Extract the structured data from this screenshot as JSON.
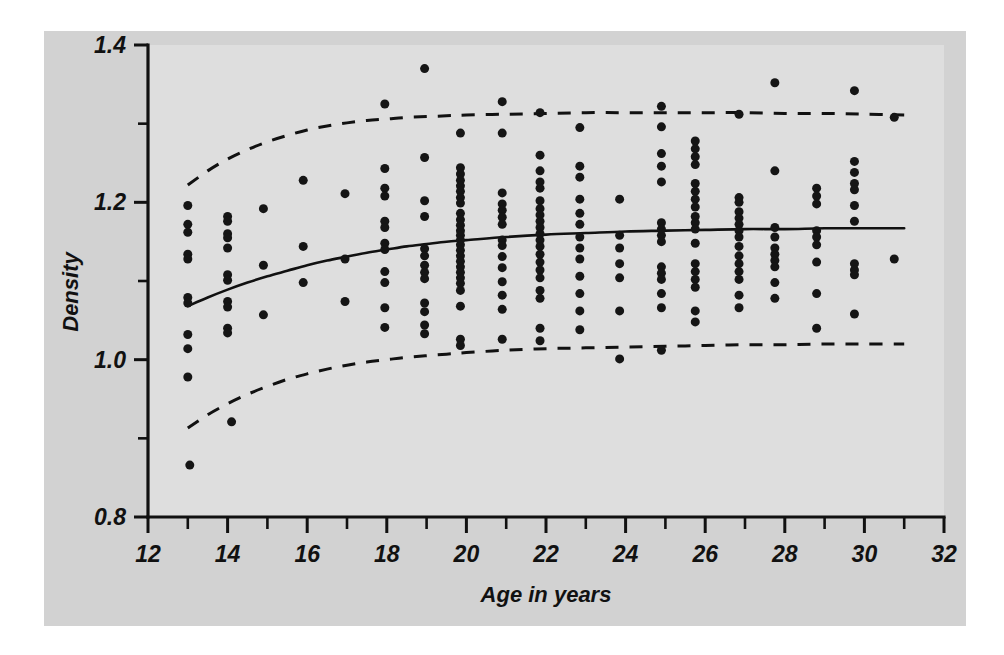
{
  "figure": {
    "background_color": "#d2d2d2",
    "plot_background_color": "#dedede",
    "outer_color": "#ffffff",
    "ink_color": "#111111"
  },
  "axes": {
    "y_title": "Density",
    "x_title": "Age in years",
    "y_major_labels": [
      "1.4",
      "1.2",
      "1.0",
      "0.8"
    ],
    "x_major_labels": [
      "12",
      "14",
      "16",
      "18",
      "20",
      "22",
      "24",
      "26",
      "28",
      "30",
      "32"
    ]
  },
  "chart_data": {
    "type": "scatter",
    "title": "",
    "subtitle": "",
    "xlabel": "Age in years",
    "ylabel": "Density",
    "xlim": [
      12,
      32
    ],
    "ylim": [
      0.8,
      1.4
    ],
    "x_major_ticks": [
      12,
      14,
      16,
      18,
      20,
      22,
      24,
      26,
      28,
      30,
      32
    ],
    "x_minor_ticks": [
      13,
      15,
      17,
      19,
      21,
      23,
      25,
      27,
      29,
      31
    ],
    "y_major_ticks": [
      0.8,
      1.0,
      1.2,
      1.4
    ],
    "y_minor_ticks": [
      0.9,
      1.1,
      1.3
    ],
    "grid": false,
    "legend": null,
    "marker": {
      "shape": "circle",
      "color": "#151515",
      "size_px": 9
    },
    "points": [
      [
        13.0,
        1.196
      ],
      [
        13.0,
        1.172
      ],
      [
        13.0,
        1.162
      ],
      [
        13.0,
        1.134
      ],
      [
        13.0,
        1.128
      ],
      [
        13.0,
        1.079
      ],
      [
        13.0,
        1.072
      ],
      [
        13.0,
        1.032
      ],
      [
        13.0,
        1.014
      ],
      [
        13.0,
        0.978
      ],
      [
        13.05,
        0.866
      ],
      [
        14.0,
        1.182
      ],
      [
        14.0,
        1.176
      ],
      [
        14.0,
        1.16
      ],
      [
        14.0,
        1.155
      ],
      [
        14.0,
        1.142
      ],
      [
        14.0,
        1.108
      ],
      [
        14.0,
        1.101
      ],
      [
        14.0,
        1.074
      ],
      [
        14.0,
        1.067
      ],
      [
        14.0,
        1.04
      ],
      [
        14.0,
        1.034
      ],
      [
        14.1,
        0.921
      ],
      [
        14.9,
        1.192
      ],
      [
        14.9,
        1.12
      ],
      [
        14.9,
        1.057
      ],
      [
        15.9,
        1.228
      ],
      [
        15.9,
        1.144
      ],
      [
        15.9,
        1.098
      ],
      [
        16.95,
        1.211
      ],
      [
        16.95,
        1.128
      ],
      [
        16.95,
        1.074
      ],
      [
        17.95,
        1.325
      ],
      [
        17.95,
        1.243
      ],
      [
        17.95,
        1.218
      ],
      [
        17.95,
        1.208
      ],
      [
        17.95,
        1.176
      ],
      [
        17.95,
        1.168
      ],
      [
        17.95,
        1.148
      ],
      [
        17.95,
        1.14
      ],
      [
        17.95,
        1.112
      ],
      [
        17.95,
        1.098
      ],
      [
        17.95,
        1.066
      ],
      [
        17.95,
        1.041
      ],
      [
        18.95,
        1.37
      ],
      [
        18.95,
        1.257
      ],
      [
        18.95,
        1.202
      ],
      [
        18.95,
        1.182
      ],
      [
        18.95,
        1.141
      ],
      [
        18.95,
        1.132
      ],
      [
        18.95,
        1.12
      ],
      [
        18.95,
        1.111
      ],
      [
        18.95,
        1.103
      ],
      [
        18.95,
        1.072
      ],
      [
        18.95,
        1.061
      ],
      [
        18.95,
        1.044
      ],
      [
        18.95,
        1.033
      ],
      [
        19.85,
        1.288
      ],
      [
        19.85,
        1.244
      ],
      [
        19.85,
        1.236
      ],
      [
        19.85,
        1.228
      ],
      [
        19.85,
        1.221
      ],
      [
        19.85,
        1.214
      ],
      [
        19.85,
        1.206
      ],
      [
        19.85,
        1.199
      ],
      [
        19.85,
        1.186
      ],
      [
        19.85,
        1.178
      ],
      [
        19.85,
        1.171
      ],
      [
        19.85,
        1.164
      ],
      [
        19.85,
        1.158
      ],
      [
        19.85,
        1.152
      ],
      [
        19.85,
        1.146
      ],
      [
        19.85,
        1.139
      ],
      [
        19.85,
        1.132
      ],
      [
        19.85,
        1.125
      ],
      [
        19.85,
        1.118
      ],
      [
        19.85,
        1.111
      ],
      [
        19.85,
        1.104
      ],
      [
        19.85,
        1.097
      ],
      [
        19.85,
        1.088
      ],
      [
        19.85,
        1.068
      ],
      [
        19.85,
        1.026
      ],
      [
        19.85,
        1.018
      ],
      [
        20.9,
        1.328
      ],
      [
        20.9,
        1.288
      ],
      [
        20.9,
        1.212
      ],
      [
        20.9,
        1.198
      ],
      [
        20.9,
        1.19
      ],
      [
        20.9,
        1.181
      ],
      [
        20.9,
        1.172
      ],
      [
        20.9,
        1.152
      ],
      [
        20.9,
        1.145
      ],
      [
        20.9,
        1.131
      ],
      [
        20.9,
        1.117
      ],
      [
        20.9,
        1.099
      ],
      [
        20.9,
        1.082
      ],
      [
        20.9,
        1.064
      ],
      [
        20.9,
        1.026
      ],
      [
        21.85,
        1.314
      ],
      [
        21.85,
        1.26
      ],
      [
        21.85,
        1.24
      ],
      [
        21.85,
        1.226
      ],
      [
        21.85,
        1.218
      ],
      [
        21.85,
        1.202
      ],
      [
        21.85,
        1.192
      ],
      [
        21.85,
        1.184
      ],
      [
        21.85,
        1.176
      ],
      [
        21.85,
        1.168
      ],
      [
        21.85,
        1.16
      ],
      [
        21.85,
        1.152
      ],
      [
        21.85,
        1.144
      ],
      [
        21.85,
        1.134
      ],
      [
        21.85,
        1.124
      ],
      [
        21.85,
        1.114
      ],
      [
        21.85,
        1.104
      ],
      [
        21.85,
        1.088
      ],
      [
        21.85,
        1.078
      ],
      [
        21.85,
        1.04
      ],
      [
        21.85,
        1.024
      ],
      [
        22.85,
        1.295
      ],
      [
        22.85,
        1.246
      ],
      [
        22.85,
        1.232
      ],
      [
        22.85,
        1.204
      ],
      [
        22.85,
        1.186
      ],
      [
        22.85,
        1.172
      ],
      [
        22.85,
        1.156
      ],
      [
        22.85,
        1.142
      ],
      [
        22.85,
        1.128
      ],
      [
        22.85,
        1.106
      ],
      [
        22.85,
        1.084
      ],
      [
        22.85,
        1.062
      ],
      [
        22.85,
        1.038
      ],
      [
        23.85,
        1.204
      ],
      [
        23.85,
        1.158
      ],
      [
        23.85,
        1.142
      ],
      [
        23.85,
        1.122
      ],
      [
        23.85,
        1.104
      ],
      [
        23.85,
        1.062
      ],
      [
        23.85,
        1.001
      ],
      [
        24.9,
        1.322
      ],
      [
        24.9,
        1.296
      ],
      [
        24.9,
        1.262
      ],
      [
        24.9,
        1.246
      ],
      [
        24.9,
        1.226
      ],
      [
        24.9,
        1.174
      ],
      [
        24.9,
        1.166
      ],
      [
        24.9,
        1.158
      ],
      [
        24.9,
        1.15
      ],
      [
        24.9,
        1.118
      ],
      [
        24.9,
        1.11
      ],
      [
        24.9,
        1.102
      ],
      [
        24.9,
        1.084
      ],
      [
        24.9,
        1.066
      ],
      [
        24.9,
        1.012
      ],
      [
        25.75,
        1.278
      ],
      [
        25.75,
        1.268
      ],
      [
        25.75,
        1.258
      ],
      [
        25.75,
        1.248
      ],
      [
        25.75,
        1.224
      ],
      [
        25.75,
        1.214
      ],
      [
        25.75,
        1.204
      ],
      [
        25.75,
        1.194
      ],
      [
        25.75,
        1.182
      ],
      [
        25.75,
        1.174
      ],
      [
        25.75,
        1.166
      ],
      [
        25.75,
        1.148
      ],
      [
        25.75,
        1.122
      ],
      [
        25.75,
        1.112
      ],
      [
        25.75,
        1.102
      ],
      [
        25.75,
        1.092
      ],
      [
        25.75,
        1.062
      ],
      [
        25.75,
        1.048
      ],
      [
        26.85,
        1.312
      ],
      [
        26.85,
        1.206
      ],
      [
        26.85,
        1.2
      ],
      [
        26.85,
        1.188
      ],
      [
        26.85,
        1.18
      ],
      [
        26.85,
        1.172
      ],
      [
        26.85,
        1.164
      ],
      [
        26.85,
        1.156
      ],
      [
        26.85,
        1.144
      ],
      [
        26.85,
        1.132
      ],
      [
        26.85,
        1.122
      ],
      [
        26.85,
        1.112
      ],
      [
        26.85,
        1.102
      ],
      [
        26.85,
        1.082
      ],
      [
        26.85,
        1.066
      ],
      [
        27.75,
        1.352
      ],
      [
        27.75,
        1.24
      ],
      [
        27.75,
        1.168
      ],
      [
        27.75,
        1.156
      ],
      [
        27.75,
        1.142
      ],
      [
        27.75,
        1.134
      ],
      [
        27.75,
        1.126
      ],
      [
        27.75,
        1.118
      ],
      [
        27.75,
        1.098
      ],
      [
        27.75,
        1.078
      ],
      [
        28.8,
        1.218
      ],
      [
        28.8,
        1.208
      ],
      [
        28.8,
        1.198
      ],
      [
        28.8,
        1.164
      ],
      [
        28.8,
        1.156
      ],
      [
        28.8,
        1.146
      ],
      [
        28.8,
        1.124
      ],
      [
        28.8,
        1.084
      ],
      [
        28.8,
        1.04
      ],
      [
        29.75,
        1.342
      ],
      [
        29.75,
        1.252
      ],
      [
        29.75,
        1.238
      ],
      [
        29.75,
        1.224
      ],
      [
        29.75,
        1.216
      ],
      [
        29.75,
        1.196
      ],
      [
        29.75,
        1.176
      ],
      [
        29.75,
        1.122
      ],
      [
        29.75,
        1.114
      ],
      [
        29.75,
        1.108
      ],
      [
        29.75,
        1.058
      ],
      [
        30.75,
        1.308
      ],
      [
        30.75,
        1.128
      ]
    ],
    "series": [
      {
        "name": "fitted-median",
        "style": "solid",
        "x": [
          13.0,
          13.5,
          14.0,
          14.5,
          15.0,
          15.5,
          16.0,
          16.5,
          17.0,
          17.5,
          18.0,
          18.5,
          19.0,
          19.5,
          20.0,
          21.0,
          22.0,
          23.0,
          24.0,
          25.0,
          26.0,
          27.0,
          28.0,
          29.0,
          30.0,
          31.0
        ],
        "values": [
          1.068,
          1.079,
          1.089,
          1.098,
          1.106,
          1.113,
          1.12,
          1.126,
          1.131,
          1.136,
          1.14,
          1.144,
          1.147,
          1.15,
          1.152,
          1.156,
          1.159,
          1.161,
          1.163,
          1.164,
          1.165,
          1.166,
          1.166,
          1.167,
          1.167,
          1.167
        ]
      },
      {
        "name": "upper-reference-band",
        "style": "dashed",
        "x": [
          13.0,
          13.5,
          14.0,
          14.5,
          15.0,
          15.5,
          16.0,
          16.5,
          17.0,
          17.5,
          18.0,
          18.5,
          19.0,
          19.5,
          20.0,
          21.0,
          22.0,
          23.0,
          24.0,
          25.0,
          26.0,
          27.0,
          28.0,
          29.0,
          30.0,
          31.0
        ],
        "values": [
          1.222,
          1.24,
          1.255,
          1.267,
          1.277,
          1.285,
          1.292,
          1.297,
          1.301,
          1.304,
          1.306,
          1.308,
          1.309,
          1.31,
          1.311,
          1.312,
          1.313,
          1.314,
          1.314,
          1.314,
          1.314,
          1.314,
          1.313,
          1.313,
          1.312,
          1.311
        ]
      },
      {
        "name": "lower-reference-band",
        "style": "dashed",
        "x": [
          13.0,
          13.5,
          14.0,
          14.5,
          15.0,
          15.5,
          16.0,
          16.5,
          17.0,
          17.5,
          18.0,
          18.5,
          19.0,
          19.5,
          20.0,
          21.0,
          22.0,
          23.0,
          24.0,
          25.0,
          26.0,
          27.0,
          28.0,
          29.0,
          30.0,
          31.0
        ],
        "values": [
          0.913,
          0.93,
          0.944,
          0.956,
          0.966,
          0.975,
          0.982,
          0.988,
          0.993,
          0.997,
          1.0,
          1.003,
          1.005,
          1.007,
          1.009,
          1.012,
          1.014,
          1.015,
          1.016,
          1.017,
          1.018,
          1.019,
          1.019,
          1.02,
          1.02,
          1.02
        ]
      }
    ]
  }
}
